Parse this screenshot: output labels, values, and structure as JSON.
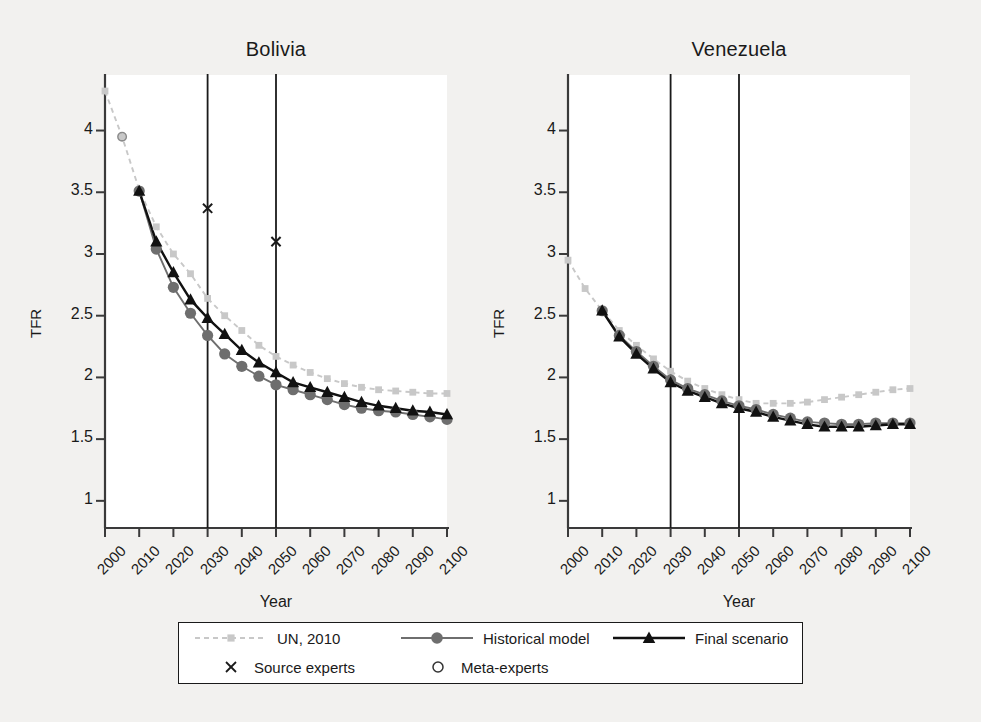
{
  "figure": {
    "background_color": "#f2f1ef",
    "plot_background_color": "#ffffff",
    "axis_color": "#3a3a3a"
  },
  "axis": {
    "ylabel": "TFR",
    "xlabel": "Year",
    "ytick_labels": [
      "1",
      "1.5",
      "2",
      "2.5",
      "3",
      "3.5",
      "4"
    ],
    "xtick_labels": [
      "2000",
      "2010",
      "2020",
      "2030",
      "2040",
      "2050",
      "2060",
      "2070",
      "2080",
      "2090",
      "2100"
    ]
  },
  "legend": {
    "items": [
      {
        "label": "UN, 2010",
        "marker": "square",
        "color": "#c8c8c8",
        "line": "dashed"
      },
      {
        "label": "Historical model",
        "marker": "circle",
        "color": "#6e6e6e",
        "line": "solid"
      },
      {
        "label": "Final scenario",
        "marker": "triangle",
        "color": "#111111",
        "line": "solid"
      },
      {
        "label": "Source experts",
        "marker": "cross",
        "color": "#1a1a1a",
        "line": "none"
      },
      {
        "label": "Meta-experts",
        "marker": "open-circle",
        "color": "#8a8a8a",
        "line": "none"
      }
    ]
  },
  "chart_data": [
    {
      "type": "line",
      "title": "Bolivia",
      "xlabel": "Year",
      "ylabel": "TFR",
      "xlim": [
        2000,
        2100
      ],
      "ylim": [
        0.78,
        4.45
      ],
      "grid": false,
      "legend_position": "bottom",
      "vertical_reference_lines": [
        2030,
        2050
      ],
      "series": [
        {
          "name": "UN, 2010",
          "marker": "square",
          "color": "#c8c8c8",
          "line": "dashed",
          "x": [
            2000,
            2005,
            2010,
            2015,
            2020,
            2025,
            2030,
            2035,
            2040,
            2045,
            2050,
            2055,
            2060,
            2065,
            2070,
            2075,
            2080,
            2085,
            2090,
            2095,
            2100
          ],
          "y": [
            4.32,
            3.95,
            3.52,
            3.22,
            3.0,
            2.84,
            2.64,
            2.5,
            2.38,
            2.26,
            2.17,
            2.1,
            2.04,
            1.99,
            1.95,
            1.92,
            1.9,
            1.89,
            1.88,
            1.87,
            1.87
          ]
        },
        {
          "name": "Historical model",
          "marker": "circle",
          "color": "#6e6e6e",
          "line": "solid",
          "x": [
            2010,
            2015,
            2020,
            2025,
            2030,
            2035,
            2040,
            2045,
            2050,
            2055,
            2060,
            2065,
            2070,
            2075,
            2080,
            2085,
            2090,
            2095,
            2100
          ],
          "y": [
            3.51,
            3.04,
            2.73,
            2.52,
            2.34,
            2.19,
            2.09,
            2.01,
            1.94,
            1.9,
            1.86,
            1.82,
            1.78,
            1.75,
            1.73,
            1.72,
            1.7,
            1.68,
            1.66
          ]
        },
        {
          "name": "Final scenario",
          "marker": "triangle",
          "color": "#111111",
          "line": "solid",
          "x": [
            2010,
            2015,
            2020,
            2025,
            2030,
            2035,
            2040,
            2045,
            2050,
            2055,
            2060,
            2065,
            2070,
            2075,
            2080,
            2085,
            2090,
            2095,
            2100
          ],
          "y": [
            3.51,
            3.1,
            2.85,
            2.63,
            2.48,
            2.35,
            2.22,
            2.12,
            2.04,
            1.96,
            1.92,
            1.88,
            1.84,
            1.8,
            1.77,
            1.75,
            1.73,
            1.72,
            1.7
          ]
        },
        {
          "name": "Source experts",
          "marker": "cross",
          "color": "#1a1a1a",
          "line": "none",
          "x": [
            2030,
            2050
          ],
          "y": [
            3.37,
            3.1
          ]
        },
        {
          "name": "Meta-experts",
          "marker": "open-circle",
          "color": "#8a8a8a",
          "line": "none",
          "x": [
            2005
          ],
          "y": [
            3.95
          ]
        }
      ]
    },
    {
      "type": "line",
      "title": "Venezuela",
      "xlabel": "Year",
      "ylabel": "TFR",
      "xlim": [
        2000,
        2100
      ],
      "ylim": [
        0.78,
        4.45
      ],
      "grid": false,
      "legend_position": "bottom",
      "vertical_reference_lines": [
        2030,
        2050
      ],
      "series": [
        {
          "name": "UN, 2010",
          "marker": "square",
          "color": "#c8c8c8",
          "line": "dashed",
          "x": [
            2000,
            2005,
            2010,
            2015,
            2020,
            2025,
            2030,
            2035,
            2040,
            2045,
            2050,
            2055,
            2060,
            2065,
            2070,
            2075,
            2080,
            2085,
            2090,
            2095,
            2100
          ],
          "y": [
            2.95,
            2.72,
            2.54,
            2.38,
            2.26,
            2.15,
            2.05,
            1.97,
            1.91,
            1.86,
            1.82,
            1.79,
            1.79,
            1.79,
            1.8,
            1.82,
            1.84,
            1.86,
            1.88,
            1.9,
            1.91
          ]
        },
        {
          "name": "Historical model",
          "marker": "circle",
          "color": "#6e6e6e",
          "line": "solid",
          "x": [
            2010,
            2015,
            2020,
            2025,
            2030,
            2035,
            2040,
            2045,
            2050,
            2055,
            2060,
            2065,
            2070,
            2075,
            2080,
            2085,
            2090,
            2095,
            2100
          ],
          "y": [
            2.54,
            2.34,
            2.21,
            2.09,
            1.98,
            1.91,
            1.86,
            1.81,
            1.77,
            1.74,
            1.7,
            1.67,
            1.64,
            1.63,
            1.62,
            1.62,
            1.63,
            1.63,
            1.63
          ]
        },
        {
          "name": "Final scenario",
          "marker": "triangle",
          "color": "#111111",
          "line": "solid",
          "x": [
            2010,
            2015,
            2020,
            2025,
            2030,
            2035,
            2040,
            2045,
            2050,
            2055,
            2060,
            2065,
            2070,
            2075,
            2080,
            2085,
            2090,
            2095,
            2100
          ],
          "y": [
            2.54,
            2.33,
            2.19,
            2.07,
            1.96,
            1.89,
            1.84,
            1.79,
            1.75,
            1.72,
            1.68,
            1.65,
            1.62,
            1.6,
            1.6,
            1.6,
            1.61,
            1.62,
            1.62
          ]
        }
      ]
    }
  ]
}
